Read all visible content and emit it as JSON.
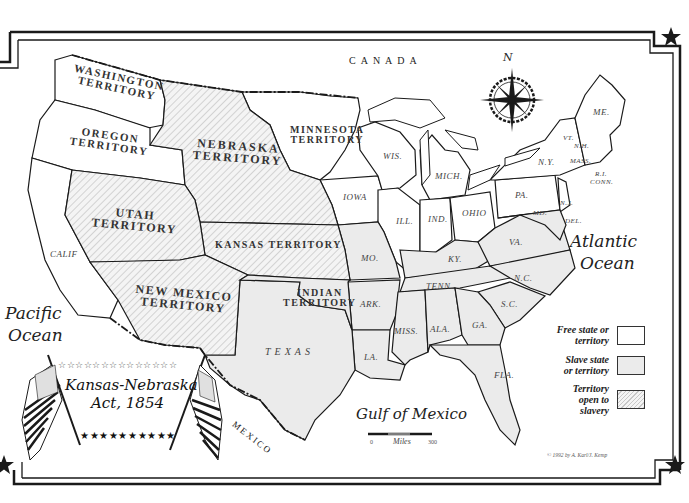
{
  "map": {
    "title_line1": "Kansas-Nebraska",
    "title_line2": "Act, 1854",
    "countries": {
      "canada": "CANADA",
      "mexico": "MEXICO"
    },
    "oceans": {
      "pacific_line1": "Pacific",
      "pacific_line2": "Ocean",
      "atlantic_line1": "Atlantic",
      "atlantic_line2": "Ocean",
      "gulf": "Gulf of Mexico"
    },
    "territories": {
      "washington": [
        "WASHINGTON",
        "TERRITORY"
      ],
      "oregon": [
        "OREGON",
        "TERRITORY"
      ],
      "nebraska": [
        "NEBRASKA",
        "TERRITORY"
      ],
      "minnesota": [
        "MINNESOTA",
        "TERRITORY"
      ],
      "utah": [
        "UTAH",
        "TERRITORY"
      ],
      "kansas": "KANSAS TERRITORY",
      "new_mexico": [
        "NEW MEXICO",
        "TERRITORY"
      ],
      "indian": [
        "INDIAN",
        "TERRITORY"
      ]
    },
    "states": {
      "calif": "CALIF",
      "texas": "TEXAS",
      "iowa": "IOWA",
      "wis": "WIS.",
      "mich": "MICH.",
      "ill": "ILL.",
      "ind": "IND.",
      "ohio": "OHIO",
      "pa": "PA.",
      "ny": "N.Y.",
      "vt": "VT.",
      "nh": "N.H.",
      "me": "ME.",
      "mass": "MASS.",
      "ri": "R.I.",
      "conn": "CONN.",
      "nj": "N.J.",
      "del": "DEL.",
      "md": "MD.",
      "va": "VA.",
      "ky": "KY.",
      "mo": "MO.",
      "tenn": "TENN.",
      "nc": "N.C.",
      "sc": "S.C.",
      "ark": "ARK.",
      "la": "LA.",
      "miss": "MISS.",
      "ala": "ALA.",
      "ga": "GA.",
      "fla": "FLA."
    },
    "compass": {
      "north_label": "N"
    },
    "scale": {
      "start": "0",
      "label": "Miles",
      "end": "300"
    },
    "credit": "© 1992 by A. Karl/J. Kemp"
  },
  "legend": {
    "items": [
      {
        "label_line1": "Free state or",
        "label_line2": "territory",
        "label_line3": "",
        "fill": "#ffffff",
        "pattern": "none"
      },
      {
        "label_line1": "Slave state",
        "label_line2": "or territory",
        "label_line3": "",
        "fill": "#ebebeb",
        "pattern": "none"
      },
      {
        "label_line1": "Territory",
        "label_line2": "open to",
        "label_line3": "slavery",
        "fill": "#f2f2f2",
        "pattern": "hatch"
      }
    ]
  },
  "colors": {
    "free": "#ffffff",
    "slave": "#ebebeb",
    "open_hatch_bg": "#f4f4f4",
    "hatch_line": "#c8c8c8",
    "border": "#1a1a1a"
  }
}
